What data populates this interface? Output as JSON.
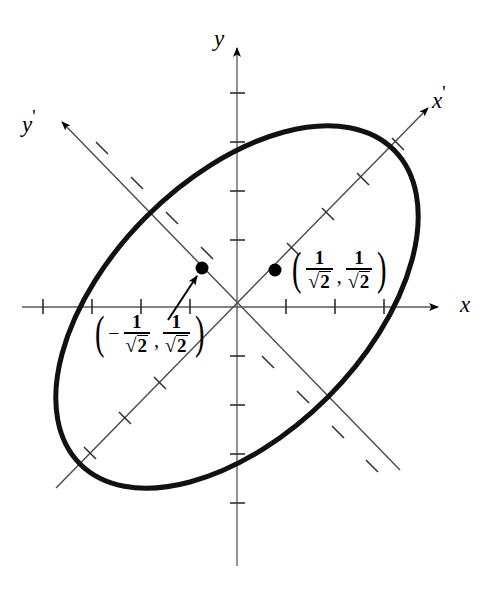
{
  "figure": {
    "background_color": "#ffffff",
    "ink_color": "#000000",
    "curve_color": "#111111",
    "width": 495,
    "height": 590
  },
  "axes": {
    "origin": {
      "x": 237,
      "y": 307
    },
    "tick_spacing": 49,
    "x_axis": {
      "label": "x",
      "label_position": {
        "x": 462,
        "y": 296
      },
      "start": {
        "x": 22,
        "y": 307
      },
      "end": {
        "x": 440,
        "y": 307
      },
      "ticks_negative": 4,
      "ticks_positive": 4
    },
    "y_axis": {
      "label": "y",
      "label_position": {
        "x": 215,
        "y": 32
      },
      "start": {
        "x": 237,
        "y": 560
      },
      "end": {
        "x": 237,
        "y": 45
      },
      "ticks_negative": 5,
      "ticks_positive": 5
    },
    "x_prime_axis": {
      "label": "x",
      "prime": "'",
      "label_position": {
        "x": 440,
        "y": 86
      },
      "angle_degrees": 45,
      "start": {
        "x": 56,
        "y": 488
      },
      "end": {
        "x": 428,
        "y": 108
      },
      "tick_count_each_side": 4
    },
    "y_prime_axis": {
      "label": "y",
      "prime": "'",
      "label_position": {
        "x": 22,
        "y": 110
      },
      "angle_degrees": 135,
      "start": {
        "x": 62,
        "y": 122
      },
      "end": {
        "x": 400,
        "y": 470
      },
      "tick_count_each_side": 4
    }
  },
  "ellipse": {
    "center": {
      "x": 237,
      "y": 307
    },
    "semi_major": 222,
    "semi_minor": 128,
    "rotation_degrees": -45,
    "stroke_width": 5,
    "color": "#111111"
  },
  "points": [
    {
      "id": "point-positive",
      "x": 275,
      "y": 270,
      "radius": 6,
      "label_x_coord_numerator": "1",
      "label_x_coord_denominator": "2",
      "label_y_coord_numerator": "1",
      "label_y_coord_denominator": "2",
      "label_negative": false,
      "label_position": {
        "x": 291,
        "y": 254
      },
      "label_text": "(1/√2, 1/√2)"
    },
    {
      "id": "point-negative",
      "x": 202,
      "y": 268,
      "radius": 6,
      "label_x_coord_numerator": "1",
      "label_x_coord_denominator": "2",
      "label_y_coord_numerator": "1",
      "label_y_coord_denominator": "2",
      "label_negative": true,
      "label_position": {
        "x": 94,
        "y": 318
      },
      "label_text": "(−1/√2, 1/√2)"
    }
  ],
  "leader_arrow": {
    "from": {
      "x": 168,
      "y": 318
    },
    "to": {
      "x": 196,
      "y": 276
    },
    "description": "arrow from negative point label to its plotted point"
  },
  "glyphs": {
    "minus_sign": "−",
    "comma": ",",
    "left_paren": "(",
    "right_paren": ")",
    "sqrt_sign": "√",
    "numerator_value": "1",
    "radicand_value": "2",
    "prime_mark": "'"
  }
}
